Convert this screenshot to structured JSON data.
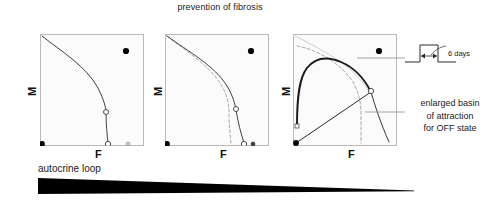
{
  "figure": {
    "title": "prevention of fibrosis",
    "width": 498,
    "height": 200
  },
  "colors": {
    "panel_background": "#fbfbfb",
    "panel_border": "#b9b9b9",
    "curve": "#1a1a1a",
    "dashed_curve": "#8f8f8f",
    "fixed_point_stable": "#000000",
    "fixed_point_unstable_fill": "#ffffff",
    "wedge": "#000000",
    "text": "#1a1a1a",
    "leader_line": "#9a9a9a"
  },
  "axes": {
    "x_label": "F",
    "y_label": "M"
  },
  "panels": [
    {
      "id": "panel-1",
      "name": "baseline-phase-plane",
      "x_label": "F",
      "y_label": "M",
      "separatrix_style": "solid",
      "has_dashed_reference": false,
      "has_trajectory": false,
      "fixed_points": [
        {
          "name": "off-state",
          "type": "stable",
          "x": 0.0,
          "y": 0.0
        },
        {
          "name": "saddle-upper",
          "type": "unstable",
          "x": 0.78,
          "y": 0.41
        },
        {
          "name": "saddle-axis",
          "type": "unstable",
          "x": 0.8,
          "y": 0.0
        },
        {
          "name": "cold-fibrosis",
          "type": "semi-stable",
          "x": 0.95,
          "y": 0.0
        },
        {
          "name": "on-state",
          "type": "stable",
          "x": 0.83,
          "y": 0.86
        }
      ]
    },
    {
      "id": "panel-2",
      "name": "partial-prevention-phase-plane",
      "x_label": "F",
      "y_label": "M",
      "separatrix_style": "solid",
      "has_dashed_reference": true,
      "has_trajectory": false,
      "fixed_points": [
        {
          "name": "off-state",
          "type": "stable",
          "x": 0.0,
          "y": 0.0
        },
        {
          "name": "saddle-upper",
          "type": "unstable",
          "x": 0.8,
          "y": 0.45
        },
        {
          "name": "saddle-axis",
          "type": "unstable",
          "x": 0.87,
          "y": 0.0
        },
        {
          "name": "cold-fibrosis",
          "type": "semi-stable",
          "x": 0.96,
          "y": 0.0
        },
        {
          "name": "on-state",
          "type": "stable",
          "x": 0.83,
          "y": 0.86
        }
      ]
    },
    {
      "id": "panel-3",
      "name": "enlarged-basin-phase-plane",
      "x_label": "F",
      "y_label": "M",
      "separatrix_style": "solid-thick",
      "has_dashed_reference": true,
      "has_trajectory": true,
      "fixed_points": [
        {
          "name": "off-state",
          "type": "stable",
          "x": 0.0,
          "y": 0.0
        },
        {
          "name": "saddle-upper",
          "type": "unstable",
          "x": 0.8,
          "y": 0.52
        },
        {
          "name": "hot-fibrosis-axis",
          "type": "unstable",
          "x": 0.0,
          "y": 0.18
        },
        {
          "name": "on-state",
          "type": "stable",
          "x": 0.83,
          "y": 0.86
        }
      ]
    }
  ],
  "gradient_bar": {
    "label": "autocrine loop",
    "direction": "decreasing-left-to-right",
    "left_thickness_px": 16,
    "right_thickness_px": 0
  },
  "annotations": {
    "pulse": {
      "duration_label": "6 days",
      "shape": "square-pulse",
      "arrow": "double-headed"
    },
    "basin": {
      "line_1": "enlarged basin",
      "line_2": "of attraction",
      "line_3": "for OFF state"
    }
  }
}
